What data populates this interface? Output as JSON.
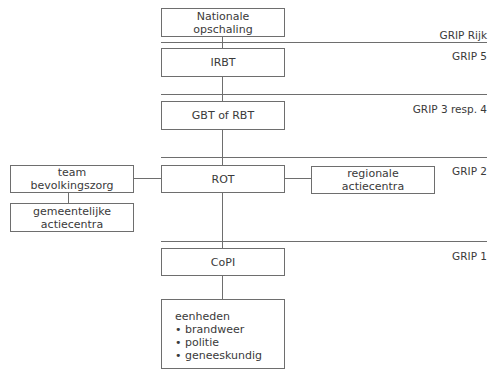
{
  "levels": [
    {
      "label": "GRIP Rijk",
      "line_y": 42,
      "label_y": 30
    },
    {
      "label": "GRIP 5",
      "line_y": null,
      "label_y": 51
    },
    {
      "label": "GRIP 3 resp. 4",
      "line_y": 94,
      "label_y": 104
    },
    {
      "label": "GRIP 2",
      "line_y": 157,
      "label_y": 166
    },
    {
      "label": "GRIP 1",
      "line_y": 241,
      "label_y": 251
    }
  ],
  "boxes": {
    "nationale": {
      "line1": "Nationale",
      "line2": "opschaling"
    },
    "irbt": {
      "label": "IRBT"
    },
    "gbt": {
      "label": "GBT of RBT"
    },
    "rot": {
      "label": "ROT"
    },
    "team": {
      "line1": "team",
      "line2": "bevolkingszorg"
    },
    "gemeentelijk": {
      "line1": "gemeentelijke",
      "line2": "actiecentra"
    },
    "regionaal": {
      "line1": "regionale",
      "line2": "actiecentra"
    },
    "copi": {
      "label": "CoPI"
    },
    "eenheden": {
      "title": "eenheden",
      "items": [
        "brandweer",
        "politie",
        "geneeskundig"
      ]
    }
  },
  "colors": {
    "line": "#6e6e6e",
    "text": "#3a3a3a",
    "background": "#ffffff"
  }
}
